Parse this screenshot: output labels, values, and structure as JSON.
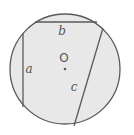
{
  "diagram": {
    "type": "circle-with-chords",
    "background": "#ffffff",
    "fill": "#e8e8e8",
    "stroke": "#5a5a5a",
    "circle": {
      "cx": 65,
      "cy": 69,
      "r": 55
    },
    "center": {
      "label": "O",
      "x": 65,
      "y": 69,
      "label_x": 64,
      "label_y": 62
    },
    "chords": [
      {
        "name": "a",
        "label": "a",
        "x1": 23,
        "y1": 33,
        "x2": 23,
        "y2": 107,
        "label_x": 29,
        "label_y": 73
      },
      {
        "name": "b",
        "label": "b",
        "x1": 35,
        "y1": 22,
        "x2": 97,
        "y2": 22,
        "label_x": 62,
        "label_y": 35
      },
      {
        "name": "c",
        "label": "c",
        "x1": 103,
        "y1": 28,
        "x2": 74,
        "y2": 126,
        "label_x": 74,
        "label_y": 91
      }
    ]
  }
}
